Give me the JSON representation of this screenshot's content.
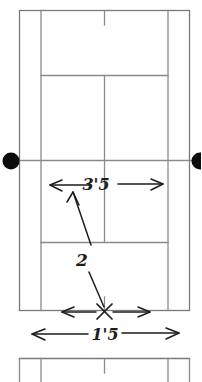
{
  "diagram": {
    "style": "hand-drawn pencil sketch",
    "colors": {
      "court_line": "#8a8a8a",
      "court_line_dark": "#6f6f6f",
      "annotation": "#1d1d1d",
      "net_post": "#000000",
      "background": "#ffffff"
    },
    "courts": [
      {
        "name": "main-court",
        "complete": true
      },
      {
        "name": "second-court-partial",
        "complete": false
      }
    ],
    "net": {
      "name": "net-line",
      "post_left_label": "net-post-left",
      "post_right_label": "net-post-right"
    },
    "annotations": [
      {
        "name": "width-dimension-upper",
        "label": "3'5",
        "kind": "dimension-arrow-double",
        "description": "horizontal double arrow above the net side service box"
      },
      {
        "name": "callout-two",
        "label": "2",
        "kind": "callout",
        "description": "leader line from X mark up to the 3'5 dimension arrow"
      },
      {
        "name": "serve-mark",
        "label": "X",
        "kind": "x-mark",
        "description": "X marking the serve position at the baseline center mark"
      },
      {
        "name": "width-dimension-inner",
        "label": "",
        "kind": "dimension-arrow-double",
        "description": "short double arrow spanning the singles width at baseline"
      },
      {
        "name": "width-dimension-lower",
        "label": "1'5",
        "kind": "dimension-arrow-double",
        "description": "long double arrow spanning the doubles width below the baseline"
      }
    ]
  }
}
